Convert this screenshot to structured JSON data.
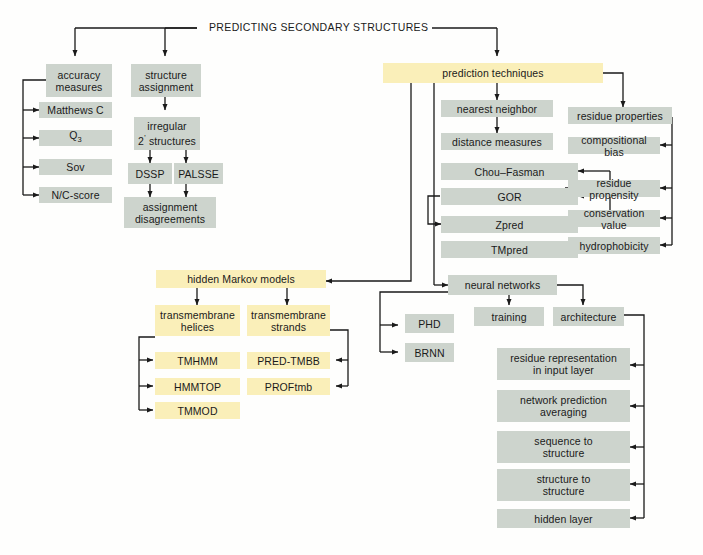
{
  "diagram": {
    "title": "PREDICTING SECONDARY STRUCTURES",
    "colors": {
      "gray_box": "#cdd4cd",
      "yellow_box": "#faefb9",
      "line": "#1a1a1a",
      "background": "#fefefd"
    },
    "nodes": {
      "accuracy_measures": "accuracy\nmeasures",
      "accuracy_measures_l1": "accuracy",
      "accuracy_measures_l2": "measures",
      "matthews_c": "Matthews C",
      "q3_base": "Q",
      "q3_sub": "3",
      "sov": "Sov",
      "nc_score": "N/C-score",
      "structure_assignment_l1": "structure",
      "structure_assignment_l2": "assignment",
      "irregular_l1": "irregular",
      "irregular_l2_pre": "2",
      "irregular_l2_sup": "’",
      "irregular_l2_post": " structures",
      "dssp": "DSSP",
      "palsse": "PALSSE",
      "assignment_dis_l1": "assignment",
      "assignment_dis_l2": "disagreements",
      "prediction_techniques": "prediction techniques",
      "nearest_neighbor": "nearest neighbor",
      "distance_measures": "distance measures",
      "chou_fasman": "Chou–Fasman",
      "gor": "GOR",
      "zpred": "Zpred",
      "tmpred": "TMpred",
      "residue_properties": "residue properties",
      "compositional_bias": "compositional bias",
      "residue_propensity": "residue propensity",
      "conservation_value": "conservation value",
      "hydrophobicity": "hydrophobicity",
      "hidden_markov_models": "hidden Markov models",
      "transmembrane_helices_l1": "transmembrane",
      "transmembrane_helices_l2": "helices",
      "transmembrane_strands_l1": "transmembrane",
      "transmembrane_strands_l2": "strands",
      "tmhmm": "TMHMM",
      "hmmtop": "HMMTOP",
      "tmmod": "TMMOD",
      "pred_tmbb": "PRED-TMBB",
      "proftmb": "PROFtmb",
      "neural_networks": "neural networks",
      "phd": "PHD",
      "brnn": "BRNN",
      "training": "training",
      "architecture": "architecture",
      "residue_representation_l1": "residue representation",
      "residue_representation_l2": "in input layer",
      "network_prediction_l1": "network prediction",
      "network_prediction_l2": "averaging",
      "sequence_to_structure_l1": "sequence to",
      "sequence_to_structure_l2": "structure",
      "structure_to_structure_l1": "structure to",
      "structure_to_structure_l2": "structure",
      "hidden_layer": "hidden layer"
    }
  }
}
